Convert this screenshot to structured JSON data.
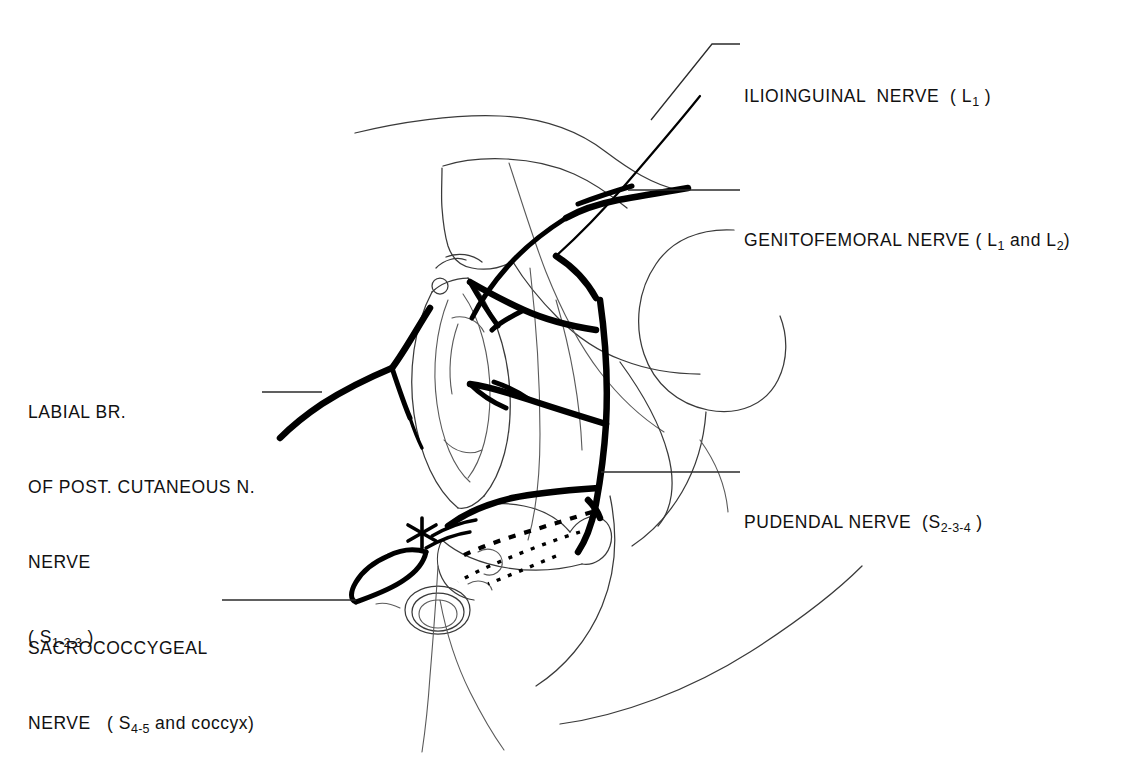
{
  "figure": {
    "kind": "anatomical-line-drawing",
    "background_color": "#ffffff",
    "ink_color": "#000000",
    "marker": {
      "name": "asterisk-marker",
      "glyph": "*",
      "location": "perianal / coccygeal region"
    }
  },
  "labels": [
    {
      "id": "ilioinguinal",
      "name": "Ilioinguinal nerve",
      "lines": [
        {
          "text": "ILIOINGUINAL  NERVE  ( L",
          "sub": "1",
          "tail": " )"
        }
      ],
      "roots": "L1",
      "side": "right",
      "leader_from": [
        740,
        44
      ],
      "leader_to": [
        651,
        120
      ]
    },
    {
      "id": "genitofemoral",
      "name": "Genitofemoral nerve",
      "lines": [
        {
          "text": "GENITOFEMORAL NERVE ( L",
          "sub": "1",
          "mid": " and L",
          "sub2": "2",
          "tail": ")"
        }
      ],
      "roots": "L1 and L2",
      "side": "right",
      "leader_from": [
        740,
        190
      ],
      "leader_to": [
        628,
        190
      ]
    },
    {
      "id": "pudendal",
      "name": "Pudendal nerve",
      "lines": [
        {
          "text": "PUDENDAL NERVE  (S",
          "sub": "2-3-4",
          "tail": " )"
        }
      ],
      "roots": "S2-3-4",
      "side": "right",
      "leader_from": [
        740,
        472
      ],
      "leader_to": [
        601,
        472
      ]
    },
    {
      "id": "labial-branch",
      "name": "Labial branch of posterior cutaneous nerve",
      "lines": [
        {
          "text": "LABIAL BR."
        },
        {
          "text": "OF POST. CUTANEOUS N."
        },
        {
          "text": "NERVE"
        },
        {
          "text": "( S",
          "sub": "1-2-3",
          "tail": " )"
        }
      ],
      "roots": "S1-2-3",
      "side": "left",
      "leader_from": [
        262,
        392
      ],
      "leader_to": [
        322,
        392
      ]
    },
    {
      "id": "sacrococcygeal",
      "name": "Sacrococcygeal nerve",
      "lines": [
        {
          "text": "SACROCOCCYGEAL"
        },
        {
          "text": "NERVE   ( S",
          "sub": "4-5",
          "tail_regular": " and coccyx)"
        }
      ],
      "roots": "S4-5 and coccyx",
      "side": "left",
      "leader_from": [
        222,
        600
      ],
      "leader_to": [
        356,
        600
      ]
    }
  ],
  "nerve_paths": {
    "ilioinguinal": "descends obliquely from upper right across the groin toward the mons pubis",
    "genitofemoral": "short bold segment running right-to-left above the inguinal fold",
    "pudendal_trunk": "vertical bold trunk at the ischial region giving three anterior branches",
    "labial_branch": "bold branch running left and forking toward the labium majus",
    "sacrococcygeal": "bold hook near the coccyx with dotted inferior rectal twigs"
  }
}
